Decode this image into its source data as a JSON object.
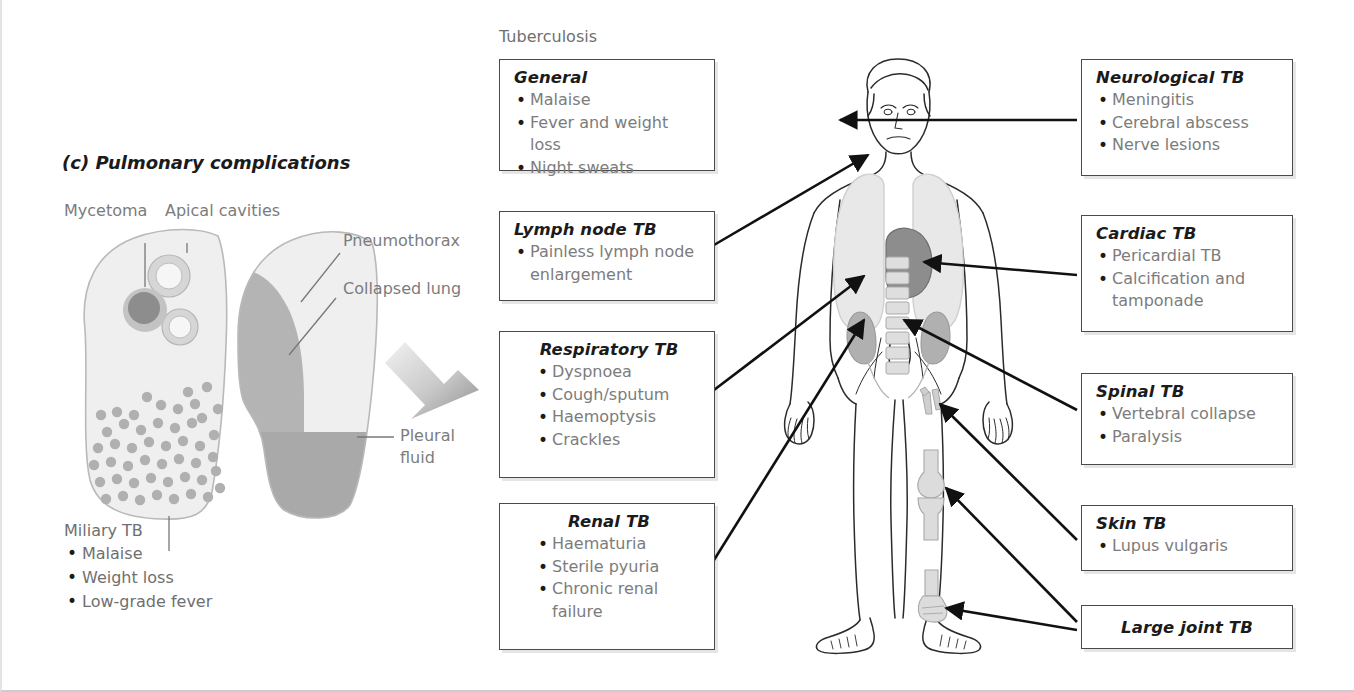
{
  "figure": {
    "main_title": "Tuberculosis",
    "panel_label": "(c) Pulmonary complications"
  },
  "lung_panel": {
    "labels": {
      "mycetoma": "Mycetoma",
      "apical_cavities": "Apical cavities",
      "pneumothorax": "Pneumothorax",
      "collapsed_lung": "Collapsed lung",
      "pleural_fluid": "Pleural\nfluid"
    },
    "miliary": {
      "title": "Miliary TB",
      "items": [
        "Malaise",
        "Weight loss",
        "Low-grade fever"
      ]
    }
  },
  "left_boxes": [
    {
      "id": "general",
      "title": "General",
      "items": [
        "Malaise",
        "Fever and weight loss",
        "Night sweats"
      ]
    },
    {
      "id": "lymph-node-tb",
      "title": "Lymph node TB",
      "items": [
        "Painless lymph node\nenlargement"
      ]
    },
    {
      "id": "respiratory-tb",
      "title": "Respiratory TB",
      "items": [
        "Dyspnoea",
        "Cough/sputum",
        "Haemoptysis",
        "Crackles"
      ]
    },
    {
      "id": "renal-tb",
      "title": "Renal TB",
      "items": [
        "Haematuria",
        "Sterile pyuria",
        "Chronic renal\nfailure"
      ]
    }
  ],
  "right_boxes": [
    {
      "id": "neurological-tb",
      "title": "Neurological TB",
      "items": [
        "Meningitis",
        "Cerebral abscess",
        "Nerve lesions"
      ]
    },
    {
      "id": "cardiac-tb",
      "title": "Cardiac TB",
      "items": [
        "Pericardial TB",
        "Calcification and\ntamponade"
      ]
    },
    {
      "id": "spinal-tb",
      "title": "Spinal TB",
      "items": [
        "Vertebral collapse",
        "Paralysis"
      ]
    },
    {
      "id": "skin-tb",
      "title": "Skin TB",
      "items": [
        "Lupus vulgaris"
      ]
    },
    {
      "id": "large-joint-tb",
      "title": "Large joint TB",
      "items": []
    }
  ],
  "anatomy": {
    "organs": [
      "lungs",
      "heart",
      "kidneys",
      "spine",
      "knee-joint",
      "ankle-joint",
      "skin-lesion"
    ]
  },
  "colors": {
    "box_border": "#4a4a4a",
    "body_text": "#7c7c7c",
    "title_text": "#1b1b1b",
    "organ_light": "#e3e3e3",
    "organ_mid": "#b6b6b6",
    "organ_dark": "#8d8d8d",
    "arrow": "#111111"
  }
}
